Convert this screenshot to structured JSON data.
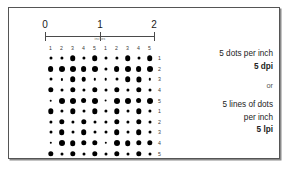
{
  "figure": {
    "frame_border_color": "#555555",
    "dot_color": "#000000",
    "background_color": "#ffffff"
  },
  "ruler": {
    "caption": "inches",
    "numbers": [
      "0",
      "1",
      "2"
    ],
    "tick_positions_pct": [
      0,
      50,
      100
    ]
  },
  "grid": {
    "column_headers": [
      "1",
      "2",
      "3",
      "4",
      "5",
      "1",
      "2",
      "3",
      "4",
      "5"
    ],
    "row_labels": [
      "1",
      "2",
      "3",
      "4",
      "5",
      "1",
      "2",
      "3",
      "4",
      "5"
    ],
    "columns": 10,
    "rows": 10,
    "dot_size_matrix": [
      [
        3.0,
        3.2,
        5.6,
        3.2,
        5.6,
        3.0,
        3.2,
        5.6,
        3.0,
        5.6
      ],
      [
        5.8,
        6.0,
        6.0,
        5.8,
        6.0,
        3.2,
        5.8,
        6.0,
        5.8,
        6.0
      ],
      [
        3.0,
        2.2,
        5.6,
        4.6,
        2.4,
        2.6,
        3.0,
        5.6,
        5.2,
        2.4
      ],
      [
        5.4,
        3.0,
        5.4,
        3.2,
        5.4,
        3.0,
        5.4,
        3.2,
        5.4,
        3.0
      ],
      [
        2.6,
        6.0,
        6.0,
        5.8,
        6.0,
        2.8,
        6.0,
        6.0,
        5.8,
        6.0
      ],
      [
        5.4,
        3.2,
        5.4,
        3.0,
        5.4,
        3.2,
        5.4,
        3.0,
        5.4,
        3.2
      ],
      [
        3.2,
        5.4,
        3.2,
        5.4,
        3.0,
        3.2,
        5.4,
        3.2,
        5.4,
        3.0
      ],
      [
        3.0,
        5.6,
        3.0,
        5.6,
        3.0,
        3.0,
        5.6,
        3.0,
        5.6,
        3.0
      ],
      [
        2.4,
        6.0,
        5.6,
        5.4,
        5.4,
        2.4,
        6.0,
        5.6,
        5.4,
        5.4
      ],
      [
        5.4,
        3.0,
        5.4,
        3.0,
        5.4,
        3.0,
        5.4,
        3.0,
        5.4,
        3.0
      ]
    ]
  },
  "legend": {
    "line1": "5 dots per inch",
    "line2": "5 dpi",
    "or": "or",
    "line3": "5 lines of dots",
    "line4": "per inch",
    "line5": "5 lpi"
  }
}
